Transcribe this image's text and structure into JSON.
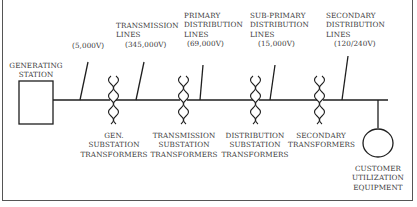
{
  "diagram": {
    "type": "power-distribution-one-line",
    "nodes": {
      "generating_station": {
        "label_lines": [
          "GENERATING",
          "STATION"
        ]
      },
      "customer_equipment": {
        "label_lines": [
          "CUSTOMER",
          "UTILIZATION",
          "EQUIPMENT"
        ]
      }
    },
    "lines": [
      {
        "id": "gen",
        "label_lines": [],
        "voltage": "(5,000V)"
      },
      {
        "id": "transmission",
        "label_lines": [
          "TRANSMISSION",
          "LINES"
        ],
        "voltage": "(345,000V)"
      },
      {
        "id": "primary",
        "label_lines": [
          "PRIMARY",
          "DISTRIBUTION",
          "LINES"
        ],
        "voltage": "(69,000V)"
      },
      {
        "id": "subprimary",
        "label_lines": [
          "SUB-PRIMARY",
          "DISTRIBUTION",
          "LINES"
        ],
        "voltage": "(15,000V)"
      },
      {
        "id": "secondary",
        "label_lines": [
          "SECONDARY",
          "DISTRIBUTION",
          "LINES"
        ],
        "voltage": "(120/240V)"
      }
    ],
    "transformers": [
      {
        "id": "gen",
        "label_lines": [
          "GEN.",
          "SUBSTATION",
          "TRANSFORMERS"
        ]
      },
      {
        "id": "transmission",
        "label_lines": [
          "TRANSMISSION",
          "SUBSTATION",
          "TRANSFORMERS"
        ]
      },
      {
        "id": "distribution",
        "label_lines": [
          "DISTRIBUTION",
          "SUBSTATION",
          "TRANSFORMERS"
        ]
      },
      {
        "id": "secondary",
        "label_lines": [
          "SECONDARY",
          "TRANSFORMERS"
        ]
      }
    ],
    "colors": {
      "line": "#1e1e1e",
      "text": "#3a3a3a",
      "frame": "#555555"
    }
  }
}
